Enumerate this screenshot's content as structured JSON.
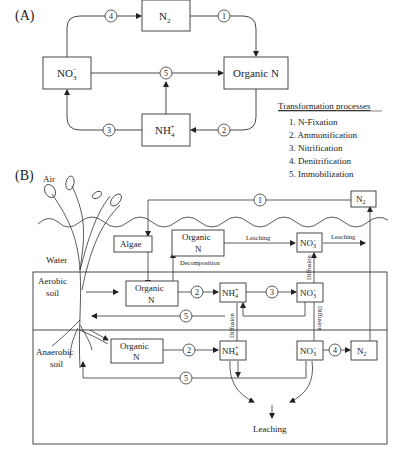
{
  "panel_a": {
    "label": "(A)",
    "nodes": {
      "n2": "N",
      "n2_sub": "2",
      "no3": "NO",
      "no3_sub": "3",
      "no3_sup": "−",
      "organic_n": "Organic N",
      "nh4": "NH",
      "nh4_sub": "4",
      "nh4_sup": "+"
    },
    "arrows": [
      "4",
      "1",
      "5",
      "3",
      "2"
    ],
    "legend": {
      "title": "Transformation processes",
      "items": [
        "1. N-Fixation",
        "2. Ammonification",
        "3. Nitrification",
        "4. Denitrification",
        "5. Immobilization"
      ]
    }
  },
  "panel_b": {
    "label": "(B)",
    "zones": {
      "air": "Air",
      "water": "Water",
      "aerobic1": "Aerobic",
      "aerobic2": "soil",
      "anaerobic1": "Anaerobic",
      "anaerobic2": "soil"
    },
    "nodes": {
      "algae": "Algae",
      "organic1": "Organic",
      "organic2": "N",
      "n2": "N",
      "n2_sub": "2",
      "no3": "NO",
      "no3_sub": "3",
      "no3_sup": "−",
      "nh4": "NH",
      "nh4_sub": "4",
      "nh4_sup": "+"
    },
    "edge_labels": {
      "leaching": "Leaching",
      "decomposition": "Decomposition",
      "diffusion": "Diffusion"
    },
    "circles": {
      "one": "1",
      "two": "2",
      "three": "3",
      "four": "4",
      "five": "5"
    }
  }
}
